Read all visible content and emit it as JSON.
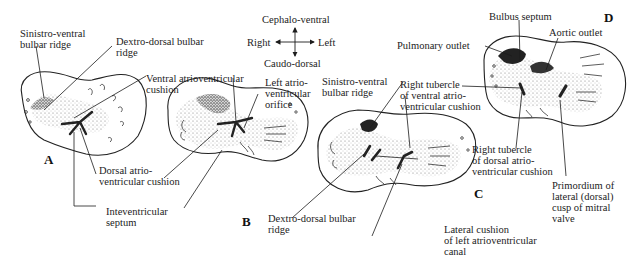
{
  "figure": {
    "orientation": {
      "top": "Cephalo-ventral",
      "bottom": "Caudo-dorsal",
      "left": "Right",
      "right": "Left"
    },
    "panels": [
      {
        "id": "A",
        "label": "A",
        "annotations": [
          "Sinistro-ventral\nbulbar ridge",
          "Dextro-dorsal bulbar\nridge",
          "Dorsal atrio-\nventricular cushion",
          "Inteventricular\nseptum"
        ]
      },
      {
        "id": "B",
        "label": "B",
        "annotations": [
          "Ventral atrioventricular\ncushion",
          "Left atrio-\nventricular\norifice"
        ]
      },
      {
        "id": "C",
        "label": "C",
        "annotations": [
          "Sinistro-ventral\nbulbar ridge",
          "Right tubercle\nof ventral atrio-\nventricular cushion",
          "Dextro-dorsal bulbar\nridge",
          "Lateral cushion\nof left atrioventricular\ncanal"
        ]
      },
      {
        "id": "D",
        "label": "D",
        "annotations": [
          "Bulbus septum",
          "Pulmonary outlet",
          "Aortic outlet",
          "Right tubercle\nof dorsal atrio-\nventricular cushion",
          "Primordium of\nlateral (dorsal)\ncusp of mitral\nvalve"
        ]
      }
    ]
  },
  "colors": {
    "ink": "#1c1c1c",
    "stipple": "#8a8a8a",
    "background": "#ffffff"
  }
}
